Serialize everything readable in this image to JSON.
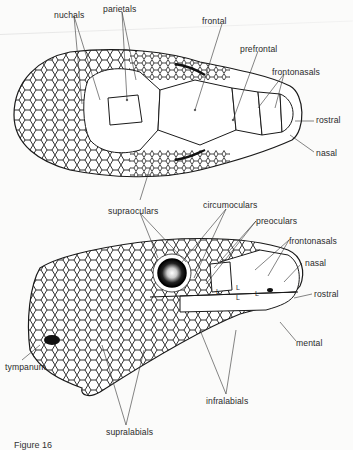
{
  "figure": {
    "caption": "Figure 16",
    "colors": {
      "ink": "#1a1a1a",
      "paper": "#fbfbfa",
      "label": "#2a2a2a"
    }
  },
  "dorsal_view": {
    "labels": [
      {
        "id": "nuchals",
        "text": "nuchals",
        "x": 54,
        "y": 10
      },
      {
        "id": "parietals",
        "text": "parietals",
        "x": 103,
        "y": 6
      },
      {
        "id": "frontal",
        "text": "frontal",
        "x": 202,
        "y": 18
      },
      {
        "id": "prefrontal",
        "text": "prefrontal",
        "x": 240,
        "y": 45
      },
      {
        "id": "frontonasals",
        "text": "frontonasals",
        "x": 272,
        "y": 68
      },
      {
        "id": "rostral",
        "text": "rostral",
        "x": 316,
        "y": 116
      },
      {
        "id": "nasal",
        "text": "nasal",
        "x": 316,
        "y": 149
      },
      {
        "id": "supraoculars",
        "text": "supraoculars",
        "x": 108,
        "y": 206
      }
    ]
  },
  "lateral_view": {
    "labels": [
      {
        "id": "circumoculars",
        "text": "circumoculars",
        "x": 196,
        "y": 202
      },
      {
        "id": "preoculars",
        "text": "preoculars",
        "x": 256,
        "y": 216
      },
      {
        "id": "frontonasals",
        "text": "frontonasals",
        "x": 289,
        "y": 236
      },
      {
        "id": "nasal",
        "text": "nasal",
        "x": 301,
        "y": 259
      },
      {
        "id": "rostral",
        "text": "rostral",
        "x": 314,
        "y": 290
      },
      {
        "id": "mental",
        "text": "mental",
        "x": 296,
        "y": 339
      },
      {
        "id": "tympanum",
        "text": "tympanum",
        "x": 5,
        "y": 362
      },
      {
        "id": "infralabials",
        "text": "infralabials",
        "x": 206,
        "y": 396
      },
      {
        "id": "supralabials",
        "text": "supralabials",
        "x": 106,
        "y": 427
      }
    ],
    "lacrimal_marks": [
      "L",
      "L",
      "L",
      "L"
    ]
  }
}
